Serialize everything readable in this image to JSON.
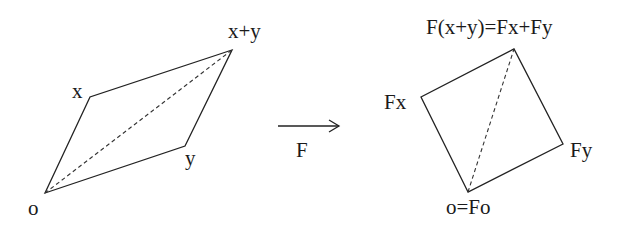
{
  "diagram": {
    "left_parallelogram": {
      "vertices": {
        "o": {
          "label": "o",
          "x": 45,
          "y": 193
        },
        "x": {
          "label": "x",
          "x": 90,
          "y": 97
        },
        "xy": {
          "label": "x+y",
          "x": 232,
          "y": 50
        },
        "y": {
          "label": "y",
          "x": 185,
          "y": 146
        }
      },
      "diagonal": "dashed from o to x+y"
    },
    "mapping_arrow": {
      "label": "F",
      "x1": 278,
      "y1": 126,
      "x2": 339,
      "y2": 126
    },
    "right_parallelogram": {
      "vertices": {
        "o": {
          "label": "o=Fo",
          "x": 468,
          "y": 192
        },
        "x": {
          "label": "Fx",
          "x": 421,
          "y": 97
        },
        "xy": {
          "label": "F(x+y)=Fx+Fy",
          "x": 514,
          "y": 49
        },
        "y": {
          "label": "Fy",
          "x": 563,
          "y": 144
        }
      },
      "diagonal": "dashed from o=Fo to F(x+y)"
    },
    "colors": {
      "stroke": "#222222",
      "background": "#ffffff"
    }
  }
}
